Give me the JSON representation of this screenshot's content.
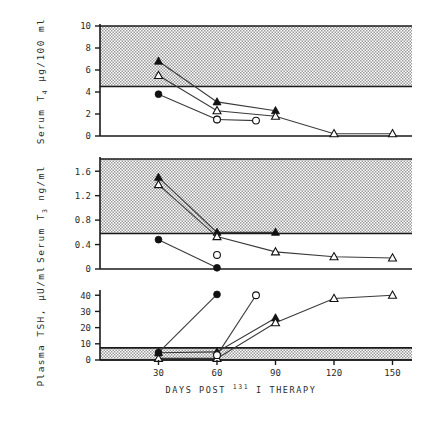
{
  "figure": {
    "xlabel_parts": {
      "pre": "DAYS POST",
      "sup": "131",
      "mid": "I",
      "post": "THERAPY"
    },
    "xaxis": {
      "ticks": [
        30,
        60,
        90,
        120,
        150
      ],
      "tick_labels": [
        "30",
        "60",
        "90",
        "120",
        "150"
      ],
      "min": 0,
      "max": 160
    },
    "shaded_band_label": "normal range (stippled band)"
  },
  "chart_data": [
    {
      "type": "line",
      "title": "",
      "panel": "top",
      "xlabel": "DAYS POST 131 I THERAPY",
      "ylabel": "Serum T4 µg/100 ml",
      "ylim": [
        0,
        10
      ],
      "yticks": [
        0,
        2,
        4,
        6,
        8,
        10
      ],
      "ytick_labels": [
        "0",
        "2",
        "4",
        "6",
        "8",
        "10"
      ],
      "xlim": [
        0,
        160
      ],
      "grid": false,
      "legend": "none",
      "normal_band": [
        4.5,
        10
      ],
      "series": [
        {
          "name": "patient-1-filled-triangle",
          "marker": "filled-triangle",
          "x": [
            30,
            60,
            90
          ],
          "y": [
            6.8,
            3.1,
            2.3
          ]
        },
        {
          "name": "patient-2-open-triangle",
          "marker": "open-triangle",
          "x": [
            30,
            60,
            90,
            120,
            150
          ],
          "y": [
            5.5,
            2.3,
            1.8,
            0.2,
            0.2
          ]
        },
        {
          "name": "patient-3-filled-circle",
          "marker": "filled-circle",
          "x": [
            30,
            60
          ],
          "y": [
            3.8,
            1.5
          ]
        },
        {
          "name": "patient-4-open-circle",
          "marker": "open-circle",
          "x": [
            60,
            80
          ],
          "y": [
            1.5,
            1.4
          ]
        }
      ]
    },
    {
      "type": "line",
      "title": "",
      "panel": "middle",
      "xlabel": "DAYS POST 131 I THERAPY",
      "ylabel": "Serum T3 ng/ml",
      "ylim": [
        0,
        1.8
      ],
      "yticks": [
        0,
        0.4,
        0.8,
        1.2,
        1.6
      ],
      "ytick_labels": [
        "0",
        "0.4",
        "0.8",
        "1.2",
        "1.6"
      ],
      "xlim": [
        0,
        160
      ],
      "grid": false,
      "legend": "none",
      "normal_band": [
        0.58,
        1.8
      ],
      "series": [
        {
          "name": "patient-1-filled-triangle",
          "marker": "filled-triangle",
          "x": [
            30,
            60,
            90
          ],
          "y": [
            1.5,
            0.6,
            0.6
          ]
        },
        {
          "name": "patient-2-open-triangle",
          "marker": "open-triangle",
          "x": [
            30,
            60,
            90,
            120,
            150
          ],
          "y": [
            1.38,
            0.53,
            0.28,
            0.2,
            0.18
          ]
        },
        {
          "name": "patient-3-filled-circle",
          "marker": "filled-circle",
          "x": [
            30,
            60
          ],
          "y": [
            0.48,
            0.02
          ]
        },
        {
          "name": "patient-4-open-circle",
          "marker": "open-circle",
          "x": [
            60
          ],
          "y": [
            0.23
          ]
        }
      ]
    },
    {
      "type": "line",
      "title": "",
      "panel": "bottom",
      "xlabel": "DAYS POST 131 I THERAPY",
      "ylabel": "Plasma TSH, µU/ml",
      "ylim": [
        0,
        42
      ],
      "yticks": [
        0,
        10,
        20,
        30,
        40
      ],
      "ytick_labels": [
        "0",
        "10",
        "20",
        "30",
        "40"
      ],
      "xlim": [
        0,
        160
      ],
      "grid": false,
      "legend": "none",
      "normal_band": [
        0,
        7.5
      ],
      "series": [
        {
          "name": "patient-1-filled-triangle",
          "marker": "filled-triangle",
          "x": [
            30,
            60,
            90
          ],
          "y": [
            4.5,
            5.0,
            26.0
          ]
        },
        {
          "name": "patient-2-open-triangle",
          "marker": "open-triangle",
          "x": [
            30,
            60,
            90,
            120,
            150
          ],
          "y": [
            1.0,
            1.0,
            23.0,
            38.0,
            40.0
          ]
        },
        {
          "name": "patient-3-filled-circle",
          "marker": "filled-circle",
          "x": [
            30,
            60
          ],
          "y": [
            4.5,
            40.5
          ]
        },
        {
          "name": "patient-4-open-circle",
          "marker": "open-circle",
          "x": [
            60,
            80
          ],
          "y": [
            3.0,
            40.0
          ]
        }
      ]
    }
  ]
}
